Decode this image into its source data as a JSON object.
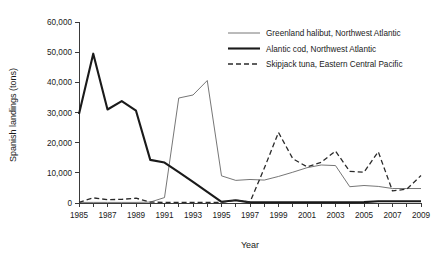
{
  "chart_data": {
    "type": "line",
    "title": "",
    "xlabel": "Year",
    "ylabel": "Spanish landings (tons)",
    "xlim": [
      1985,
      2009
    ],
    "ylim": [
      0,
      60000
    ],
    "grid": false,
    "legend_position": "top-right",
    "x_tick_labels": [
      "1985",
      "1987",
      "1989",
      "1991",
      "1993",
      "1995",
      "1997",
      "1999",
      "2001",
      "2003",
      "2005",
      "2007",
      "2009"
    ],
    "x_tick_values": [
      1985,
      1987,
      1989,
      1991,
      1993,
      1995,
      1997,
      1999,
      2001,
      2003,
      2005,
      2007,
      2009
    ],
    "x_minor_tick_values": [
      1986,
      1988,
      1990,
      1992,
      1994,
      1996,
      1998,
      2000,
      2002,
      2004,
      2006,
      2008
    ],
    "y_tick_labels": [
      "0",
      "10,000",
      "20,000",
      "30,000",
      "40,000",
      "50,000",
      "60,000"
    ],
    "y_tick_values": [
      0,
      10000,
      20000,
      30000,
      40000,
      50000,
      60000
    ],
    "x": [
      1985,
      1986,
      1987,
      1988,
      1989,
      1990,
      1991,
      1992,
      1993,
      1994,
      1995,
      1996,
      1997,
      1998,
      1999,
      2000,
      2001,
      2002,
      2003,
      2004,
      2005,
      2006,
      2007,
      2008,
      2009
    ],
    "series": [
      {
        "name": "Greenland halibut, Northwest Atlantic",
        "style": "thin-solid",
        "color": "#666666",
        "values": [
          200,
          200,
          200,
          200,
          200,
          300,
          1800,
          34800,
          35800,
          40600,
          9000,
          7500,
          7800,
          7600,
          8800,
          10200,
          11700,
          12600,
          12400,
          5400,
          5800,
          5500,
          4800,
          4800,
          4800
        ]
      },
      {
        "name": "Alantic cod, Northwest Atlantic",
        "style": "thick-solid",
        "color": "#1a1a1a",
        "values": [
          29500,
          49500,
          31000,
          33800,
          30600,
          14300,
          13400,
          10200,
          7000,
          3700,
          400,
          900,
          200,
          200,
          200,
          200,
          200,
          200,
          200,
          200,
          300,
          600,
          600,
          600,
          600
        ]
      },
      {
        "name": "Skipjack tuna, Eastern Central Pacific",
        "style": "dashed",
        "color": "#2a2a2a",
        "values": [
          200,
          1700,
          1100,
          1200,
          1600,
          300,
          200,
          200,
          200,
          200,
          200,
          900,
          300,
          11500,
          23400,
          14700,
          12000,
          13500,
          17200,
          10500,
          10200,
          17000,
          4000,
          4600,
          9100
        ]
      }
    ]
  },
  "legend": {
    "entries": [
      {
        "label": "Greenland halibut, Northwest Atlantic",
        "style": "thin-solid"
      },
      {
        "label": "Alantic cod, Northwest Atlantic",
        "style": "thick-solid"
      },
      {
        "label": "Skipjack tuna, Eastern Central Pacific",
        "style": "dashed"
      }
    ]
  }
}
